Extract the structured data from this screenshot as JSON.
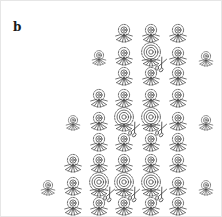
{
  "figure": {
    "panel_label": "b",
    "background_color": "#ffffff",
    "stroke_color": "#4a4a4a",
    "border_color": "#e6e6e6",
    "icon_types": {
      "normal": "flower-icon",
      "small": "small-flower-icon",
      "large": "large-spiral-flower-icon",
      "scissors": "scissors-icon"
    },
    "flowers": [
      {
        "x": 123,
        "y": 30,
        "size": "normal",
        "scissors": false
      },
      {
        "x": 150,
        "y": 30,
        "size": "normal",
        "scissors": false
      },
      {
        "x": 177,
        "y": 30,
        "size": "normal",
        "scissors": false
      },
      {
        "x": 98,
        "y": 55,
        "size": "small",
        "scissors": false
      },
      {
        "x": 123,
        "y": 53,
        "size": "normal",
        "scissors": false
      },
      {
        "x": 150,
        "y": 53,
        "size": "large",
        "scissors": true
      },
      {
        "x": 177,
        "y": 53,
        "size": "normal",
        "scissors": false
      },
      {
        "x": 205,
        "y": 56,
        "size": "small",
        "scissors": false
      },
      {
        "x": 123,
        "y": 73,
        "size": "normal",
        "scissors": false
      },
      {
        "x": 150,
        "y": 73,
        "size": "normal",
        "scissors": false
      },
      {
        "x": 177,
        "y": 73,
        "size": "normal",
        "scissors": false
      },
      {
        "x": 98,
        "y": 95,
        "size": "normal",
        "scissors": false
      },
      {
        "x": 123,
        "y": 95,
        "size": "normal",
        "scissors": false
      },
      {
        "x": 150,
        "y": 95,
        "size": "normal",
        "scissors": false
      },
      {
        "x": 177,
        "y": 95,
        "size": "normal",
        "scissors": false
      },
      {
        "x": 72,
        "y": 120,
        "size": "small",
        "scissors": false
      },
      {
        "x": 98,
        "y": 118,
        "size": "normal",
        "scissors": false
      },
      {
        "x": 123,
        "y": 118,
        "size": "large",
        "scissors": true
      },
      {
        "x": 150,
        "y": 118,
        "size": "large",
        "scissors": true
      },
      {
        "x": 177,
        "y": 118,
        "size": "normal",
        "scissors": false
      },
      {
        "x": 205,
        "y": 120,
        "size": "small",
        "scissors": false
      },
      {
        "x": 98,
        "y": 139,
        "size": "normal",
        "scissors": false
      },
      {
        "x": 123,
        "y": 139,
        "size": "normal",
        "scissors": false
      },
      {
        "x": 150,
        "y": 139,
        "size": "normal",
        "scissors": false
      },
      {
        "x": 177,
        "y": 139,
        "size": "normal",
        "scissors": false
      },
      {
        "x": 72,
        "y": 160,
        "size": "normal",
        "scissors": false
      },
      {
        "x": 98,
        "y": 160,
        "size": "normal",
        "scissors": false
      },
      {
        "x": 123,
        "y": 160,
        "size": "normal",
        "scissors": false
      },
      {
        "x": 150,
        "y": 160,
        "size": "normal",
        "scissors": false
      },
      {
        "x": 177,
        "y": 160,
        "size": "normal",
        "scissors": false
      },
      {
        "x": 47,
        "y": 185,
        "size": "small",
        "scissors": false
      },
      {
        "x": 72,
        "y": 183,
        "size": "normal",
        "scissors": false
      },
      {
        "x": 98,
        "y": 183,
        "size": "large",
        "scissors": true
      },
      {
        "x": 123,
        "y": 183,
        "size": "large",
        "scissors": true
      },
      {
        "x": 150,
        "y": 183,
        "size": "large",
        "scissors": true
      },
      {
        "x": 177,
        "y": 183,
        "size": "normal",
        "scissors": false
      },
      {
        "x": 205,
        "y": 185,
        "size": "small",
        "scissors": false
      },
      {
        "x": 72,
        "y": 203,
        "size": "normal",
        "scissors": false
      },
      {
        "x": 98,
        "y": 203,
        "size": "normal",
        "scissors": false
      },
      {
        "x": 123,
        "y": 203,
        "size": "normal",
        "scissors": false
      },
      {
        "x": 150,
        "y": 203,
        "size": "normal",
        "scissors": false
      },
      {
        "x": 177,
        "y": 203,
        "size": "normal",
        "scissors": false
      }
    ]
  }
}
